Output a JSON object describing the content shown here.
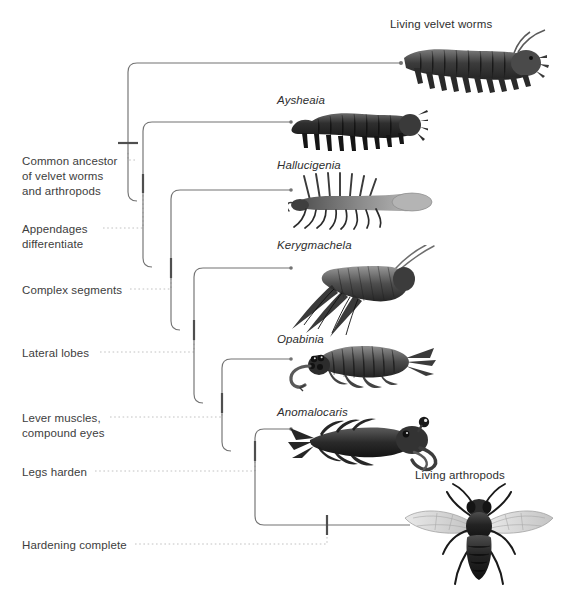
{
  "figure": {
    "type": "phylogenetic-cladogram",
    "orientation": "left-to-right ladder",
    "background_color": "#ffffff",
    "branch_color": "#6e6e6e",
    "connector_color": "#bdbdbd",
    "tick_color": "#555555",
    "text_color": "#3d3d3d"
  },
  "taxa": [
    {
      "id": "velvet-worms",
      "label": "Living velvet worms",
      "style": "roman",
      "label_x": 390,
      "label_y": 18,
      "tip_y": 63,
      "tip_x": 400,
      "art": "velvet-worm"
    },
    {
      "id": "aysheaia",
      "label": "Aysheaia",
      "style": "italic",
      "label_x": 277,
      "label_y": 94,
      "tip_y": 122,
      "tip_x": 291,
      "art": "aysheaia"
    },
    {
      "id": "hallucigenia",
      "label": "Hallucigenia",
      "style": "italic",
      "label_x": 277,
      "label_y": 159,
      "tip_y": 190,
      "tip_x": 291,
      "art": "hallucigenia"
    },
    {
      "id": "kerygmachela",
      "label": "Kerygmachela",
      "style": "italic",
      "label_x": 277,
      "label_y": 239,
      "tip_y": 268,
      "tip_x": 291,
      "art": "kerygmachela"
    },
    {
      "id": "opabinia",
      "label": "Opabinia",
      "style": "italic",
      "label_x": 277,
      "label_y": 333,
      "tip_y": 359,
      "tip_x": 291,
      "art": "opabinia"
    },
    {
      "id": "anomalocaris",
      "label": "Anomalocaris",
      "style": "italic",
      "label_x": 277,
      "label_y": 406,
      "tip_y": 429,
      "tip_x": 291,
      "art": "anomalocaris"
    },
    {
      "id": "arthropods",
      "label": "Living arthropods",
      "style": "roman",
      "label_x": 415,
      "label_y": 469,
      "tip_y": 525,
      "tip_x": 410,
      "art": "fly"
    }
  ],
  "traits": [
    {
      "id": "common-ancestor",
      "lines": [
        "Common ancestor",
        "of velvet worms",
        "and arthropods"
      ],
      "text_x": 22,
      "text_y": 154,
      "leader_from_x": 135,
      "leader_y": 160,
      "node_x": 128,
      "node_y": 143
    },
    {
      "id": "appendages-differentiate",
      "lines": [
        "Appendages",
        "differentiate"
      ],
      "text_x": 22,
      "text_y": 222,
      "leader_from_x": 103,
      "leader_y": 228,
      "node_x": 143,
      "node_y": 183
    },
    {
      "id": "complex-segments",
      "lines": [
        "Complex segments"
      ],
      "text_x": 22,
      "text_y": 283,
      "leader_from_x": 130,
      "leader_y": 289,
      "node_x": 171,
      "node_y": 268
    },
    {
      "id": "lateral-lobes",
      "lines": [
        "Lateral lobes"
      ],
      "text_x": 22,
      "text_y": 346,
      "leader_from_x": 100,
      "leader_y": 352,
      "node_x": 194,
      "node_y": 330
    },
    {
      "id": "lever-muscles-compound-eyes",
      "lines": [
        "Lever muscles,",
        "compound eyes"
      ],
      "text_x": 22,
      "text_y": 411,
      "leader_from_x": 110,
      "leader_y": 417,
      "node_x": 222,
      "node_y": 403
    },
    {
      "id": "legs-harden",
      "lines": [
        "Legs harden"
      ],
      "text_x": 22,
      "text_y": 465,
      "leader_from_x": 95,
      "leader_y": 471,
      "node_x": 255,
      "node_y": 451
    },
    {
      "id": "hardening-complete",
      "lines": [
        "Hardening complete"
      ],
      "text_x": 22,
      "text_y": 538,
      "leader_from_x": 135,
      "leader_y": 544,
      "node_x": 327,
      "node_y": 525
    }
  ]
}
